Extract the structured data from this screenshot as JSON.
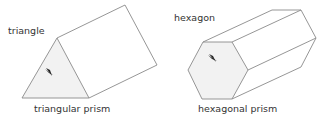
{
  "figures": [
    {
      "shape_label": "triangle",
      "caption": "triangular prism"
    },
    {
      "shape_label": "hexagon",
      "caption": "hexagonal prism"
    }
  ],
  "colors": {
    "stroke": "#8a8a8a",
    "face_fill": "#f2f2f2",
    "arrow": "#222222",
    "text": "#333333"
  }
}
